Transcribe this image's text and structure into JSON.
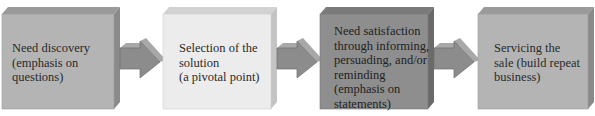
{
  "diagram": {
    "type": "process-flow",
    "steps": [
      {
        "label": "Need discovery\n(emphasis on\nquestions)",
        "face_color": "#b4b4b4",
        "top_color": "#9a9a9a",
        "side_color": "#8a8a8a"
      },
      {
        "label": "Selection of the\nsolution\n(a pivotal point)",
        "face_color": "#ececec",
        "top_color": "#d2d2d2",
        "side_color": "#c4c4c4"
      },
      {
        "label": "Need satisfaction\nthrough informing,\npersuading, and/or\nreminding\n(emphasis on\nstatements)",
        "face_color": "#8e8e8e",
        "top_color": "#7a7a7a",
        "side_color": "#6a6a6a"
      },
      {
        "label": "Servicing the\nsale (build repeat\nbusiness)",
        "face_color": "#b4b4b4",
        "top_color": "#9a9a9a",
        "side_color": "#8a8a8a"
      }
    ],
    "arrows": [
      {
        "from": 0,
        "to": 1,
        "icon": "right-arrow-icon"
      },
      {
        "from": 1,
        "to": 2,
        "icon": "right-arrow-icon"
      },
      {
        "from": 2,
        "to": 3,
        "icon": "right-arrow-icon"
      }
    ],
    "arrow_colors": {
      "face": "#8c8c8c",
      "top": "#a8a8a8",
      "edge": "#6e6e6e"
    }
  }
}
